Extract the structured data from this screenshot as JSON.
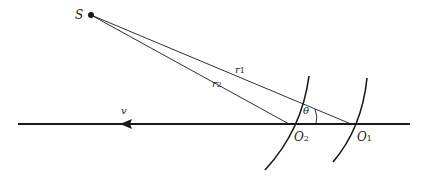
{
  "diagram": {
    "title": "",
    "labels": {
      "source": "S",
      "r1": "r",
      "r1_sub": "1",
      "r2": "r",
      "r2_sub": "2",
      "theta": "θ",
      "velocity": "v",
      "O1": "O",
      "O1_sub": "1",
      "O2": "O",
      "O2_sub": "2"
    },
    "points": {
      "S": [
        91,
        15
      ],
      "O1": [
        351,
        124
      ],
      "O2": [
        289,
        124
      ]
    },
    "axis": {
      "x_start": 18,
      "x_end": 410,
      "y": 124,
      "arrow_x": 124,
      "arrow_direction": "left"
    },
    "colors": {
      "ink": "#1a1a1a",
      "background": "#ffffff"
    }
  }
}
